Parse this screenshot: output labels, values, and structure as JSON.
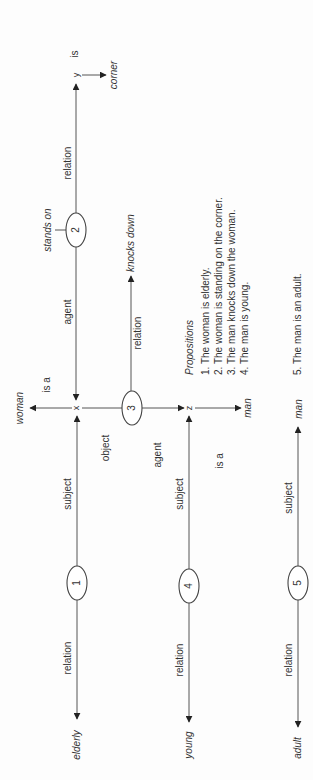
{
  "diagram": {
    "colors": {
      "line": "#555555",
      "text": "#333333",
      "background": "#fdfdfd"
    },
    "variables": {
      "x": "x",
      "y": "y",
      "z": "z"
    },
    "nodes": {
      "n1": "1",
      "n2": "2",
      "n3": "3",
      "n4": "4",
      "n5": "5"
    },
    "concepts": {
      "woman": "woman",
      "corner": "corner",
      "stands_on": "stands on",
      "knocks_down": "knocks down",
      "man_z": "man",
      "man_5": "man",
      "elderly": "elderly",
      "young": "young",
      "adult": "adult"
    },
    "edge_labels": {
      "is_corner": "is",
      "relation_2": "relation",
      "agent_2": "agent",
      "is_a_woman": "is a",
      "relation_3": "relation",
      "object_3": "object",
      "agent_3": "agent",
      "is_a_man": "is a",
      "subject_1": "subject",
      "relation_1": "relation",
      "subject_4": "subject",
      "relation_4": "relation",
      "subject_5": "subject",
      "relation_5": "relation"
    },
    "propositions": {
      "heading": "Propositions",
      "items": [
        "1.  The woman is elderly.",
        "2.  The woman is standing on the corner.",
        "3.  The man knocks down the woman.",
        "4.  The man is young.",
        "5.  The man is an adult."
      ]
    }
  }
}
